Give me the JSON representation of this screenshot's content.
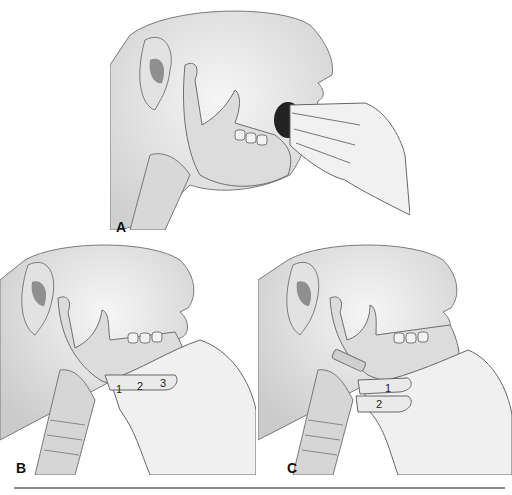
{
  "figure": {
    "panels": [
      {
        "id": "A",
        "label": "A",
        "description": "Finger sweep with fingers inserted into open mouth, jaw bone visible"
      },
      {
        "id": "B",
        "label": "B",
        "description": "Jaw thrust with three fingers under mandible",
        "finger_numbers": [
          "1",
          "2",
          "3"
        ]
      },
      {
        "id": "C",
        "label": "C",
        "description": "Jaw lift with two fingers under mandible",
        "finger_numbers": [
          "1",
          "2"
        ]
      }
    ],
    "colors": {
      "skin": "#ececec",
      "shadow": "#c8c8c8",
      "bone": "#dcdcdc",
      "outline": "#6e6e6e",
      "ear_inner": "#8f8f8f",
      "mouth_dark": "#222222",
      "rule": "#8a8a8a"
    }
  }
}
